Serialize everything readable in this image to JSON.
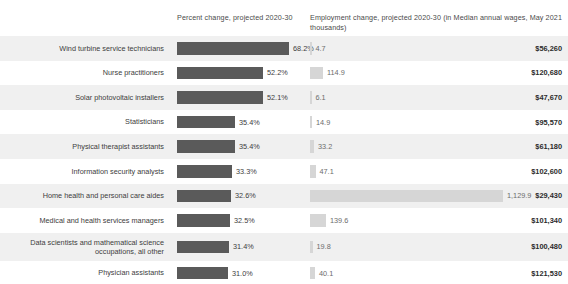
{
  "header": {
    "percent_change": "Percent change, projected 2020-30",
    "employment_change": "Employment change, projected 2020-30 (in thousands)",
    "median_wages": "Median annual wages, May 2021"
  },
  "colors": {
    "percent_bar": "#5a5a5a",
    "employment_bar": "#d6d6d6",
    "stripe": "#f0f0f0",
    "background": "#ffffff",
    "text": "#3d3d3d"
  },
  "chart_data": {
    "type": "bar",
    "title": "",
    "xlabel": "",
    "ylabel": "",
    "orientation": "horizontal",
    "grid": false,
    "legend": false,
    "categories": [
      "Wind turbine service technicians",
      "Nurse practitioners",
      "Solar photovoltaic installers",
      "Statisticians",
      "Physical therapist assistants",
      "Information security analysts",
      "Home health and personal care aides",
      "Medical and health services managers",
      "Data scientists and mathematical science occupations, all other",
      "Physician assistants"
    ],
    "series": [
      {
        "name": "Percent change, projected 2020-30",
        "unit": "percent",
        "values": [
          68.2,
          52.2,
          52.1,
          35.4,
          35.4,
          33.3,
          32.6,
          32.5,
          31.4,
          31.0
        ],
        "labels": [
          "68.2%",
          "52.2%",
          "52.1%",
          "35.4%",
          "35.4%",
          "33.3%",
          "32.6%",
          "32.5%",
          "31.4%",
          "31.0%"
        ],
        "max": 68.2
      },
      {
        "name": "Employment change, projected 2020-30 (in thousands)",
        "unit": "thousands",
        "values": [
          4.7,
          114.9,
          6.1,
          14.9,
          33.2,
          47.1,
          1129.9,
          139.6,
          19.8,
          40.1
        ],
        "labels": [
          "4.7",
          "114.9",
          "6.1",
          "14.9",
          "33.2",
          "47.1",
          "1,129.9",
          "139.6",
          "19.8",
          "40.1"
        ],
        "max": 1129.9
      },
      {
        "name": "Median annual wages, May 2021",
        "unit": "usd",
        "values": [
          56260,
          120680,
          47670,
          95570,
          61180,
          102600,
          29430,
          101340,
          100480,
          121530
        ],
        "labels": [
          "$56,260",
          "$120,680",
          "$47,670",
          "$95,570",
          "$61,180",
          "$102,600",
          "$29,430",
          "$101,340",
          "$100,480",
          "$121,530"
        ]
      }
    ]
  },
  "rows": [
    {
      "occupation": "Wind turbine service technicians",
      "pct_label": "68.2%",
      "pct_width": 112,
      "emp_label": "4.7",
      "emp_width": 1.5,
      "wage": "$56,260",
      "striped": true,
      "tall": false
    },
    {
      "occupation": "Nurse practitioners",
      "pct_label": "52.2%",
      "pct_width": 86,
      "emp_label": "114.9",
      "emp_width": 13,
      "wage": "$120,680",
      "striped": false,
      "tall": false
    },
    {
      "occupation": "Solar photovoltaic installers",
      "pct_label": "52.1%",
      "pct_width": 86,
      "emp_label": "6.1",
      "emp_width": 1.5,
      "wage": "$47,670",
      "striped": true,
      "tall": false
    },
    {
      "occupation": "Statisticians",
      "pct_label": "35.4%",
      "pct_width": 58,
      "emp_label": "14.9",
      "emp_width": 2,
      "wage": "$95,570",
      "striped": false,
      "tall": false
    },
    {
      "occupation": "Physical therapist assistants",
      "pct_label": "35.4%",
      "pct_width": 58,
      "emp_label": "33.2",
      "emp_width": 4,
      "wage": "$61,180",
      "striped": true,
      "tall": false
    },
    {
      "occupation": "Information security analysts",
      "pct_label": "33.3%",
      "pct_width": 55,
      "emp_label": "47.1",
      "emp_width": 5.5,
      "wage": "$102,600",
      "striped": false,
      "tall": false
    },
    {
      "occupation": "Home health and personal care aides",
      "pct_label": "32.6%",
      "pct_width": 54,
      "emp_label": "1,129.9",
      "emp_width": 193,
      "wage": "$29,430",
      "striped": true,
      "tall": false
    },
    {
      "occupation": "Medical and health services managers",
      "pct_label": "32.5%",
      "pct_width": 53,
      "emp_label": "139.6",
      "emp_width": 16,
      "wage": "$101,340",
      "striped": false,
      "tall": false
    },
    {
      "occupation": "Data scientists and mathematical science occupations, all other",
      "pct_label": "31.4%",
      "pct_width": 52,
      "emp_label": "19.8",
      "emp_width": 2.5,
      "wage": "$100,480",
      "striped": true,
      "tall": true
    },
    {
      "occupation": "Physician assistants",
      "pct_label": "31.0%",
      "pct_width": 51,
      "emp_label": "40.1",
      "emp_width": 5,
      "wage": "$121,530",
      "striped": false,
      "tall": false
    }
  ]
}
